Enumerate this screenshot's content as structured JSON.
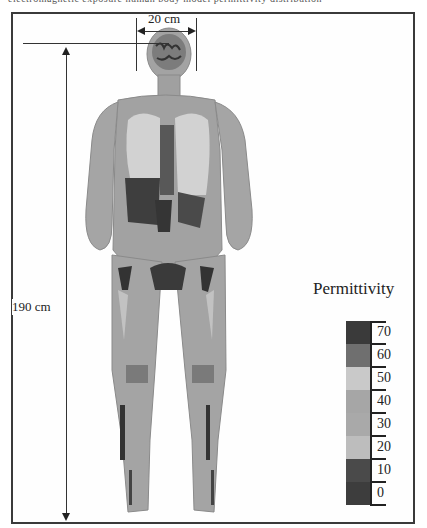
{
  "figure": {
    "top_strip_text": "electromagnetic exposure human body model permittivity distribution",
    "width_dimension": {
      "label": "20 cm"
    },
    "height_dimension": {
      "label": "190 cm"
    },
    "body_model": {
      "description": "Full-body anatomical voxel model, coronal section, greyscale permittivity map"
    }
  },
  "legend": {
    "title": "Permittivity",
    "entries": [
      {
        "value": "70",
        "color": "#3a3a3a"
      },
      {
        "value": "60",
        "color": "#6f6f6f"
      },
      {
        "value": "50",
        "color": "#c9c9c9"
      },
      {
        "value": "40",
        "color": "#a6a6a6"
      },
      {
        "value": "30",
        "color": "#a9a9a9"
      },
      {
        "value": "20",
        "color": "#bdbdbd"
      },
      {
        "value": "10",
        "color": "#4a4a4a"
      },
      {
        "value": "0",
        "color": "#3d3d3d"
      }
    ]
  }
}
